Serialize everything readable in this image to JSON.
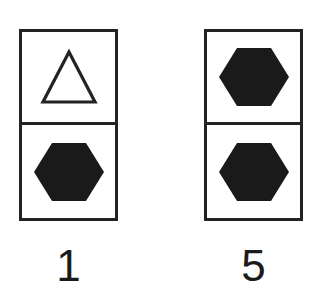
{
  "figure": {
    "background_color": "#ffffff",
    "ink_color": "#232323",
    "fill_color": "#1a1a1a",
    "items": [
      {
        "label": "1",
        "cells": [
          {
            "position": "top",
            "shape": "triangle",
            "fill": "outline",
            "icon": "triangle-outline-icon"
          },
          {
            "position": "bottom",
            "shape": "hexagon",
            "fill": "solid",
            "icon": "hexagon-solid-icon"
          }
        ]
      },
      {
        "label": "5",
        "cells": [
          {
            "position": "top",
            "shape": "hexagon",
            "fill": "solid",
            "icon": "hexagon-solid-icon"
          },
          {
            "position": "bottom",
            "shape": "hexagon",
            "fill": "solid",
            "icon": "hexagon-solid-icon"
          }
        ]
      }
    ]
  }
}
